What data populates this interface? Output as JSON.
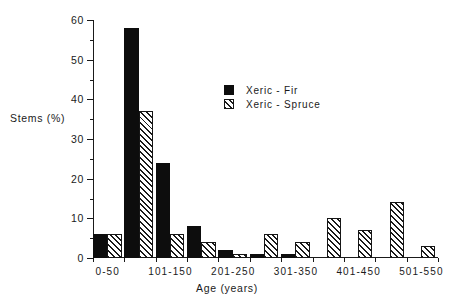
{
  "chart_data": {
    "type": "bar",
    "title": "",
    "xlabel": "Age (years)",
    "ylabel": "Stems  (%)",
    "ylim": [
      0,
      60
    ],
    "yticks": [
      0,
      10,
      20,
      30,
      40,
      50,
      60
    ],
    "ytick_labels": [
      "0",
      "10",
      "20",
      "30",
      "40",
      "50",
      "60"
    ],
    "yminor_ticks": [
      5,
      15,
      25,
      35,
      45,
      55
    ],
    "grid": false,
    "legend_position": "upper center",
    "categories": [
      "0-50",
      "51-100",
      "101-150",
      "151-200",
      "201-250",
      "251-300",
      "301-350",
      "351-400",
      "401-450",
      "451-500",
      "501-550"
    ],
    "visible_xtick_labels": [
      "0-50",
      "101-150",
      "201-250",
      "301-350",
      "401-450",
      "501-550"
    ],
    "series": [
      {
        "name": "Xeric - Fir",
        "fill": "solid-black",
        "color": "#0d0d0d",
        "values": [
          6,
          58,
          24,
          8,
          2,
          1,
          1,
          0,
          0,
          0,
          0
        ]
      },
      {
        "name": "Xeric - Spruce",
        "fill": "diagonal-hatch",
        "color": "#1a1a1a",
        "values": [
          6,
          37,
          6,
          4,
          1,
          6,
          4,
          10,
          7,
          14,
          3
        ]
      }
    ]
  },
  "legend": {
    "items": [
      {
        "label": "Xeric  -  Fir",
        "swatch": "solid-black-swatch"
      },
      {
        "label": "Xeric  -  Spruce",
        "swatch": "hatched-swatch"
      }
    ]
  }
}
